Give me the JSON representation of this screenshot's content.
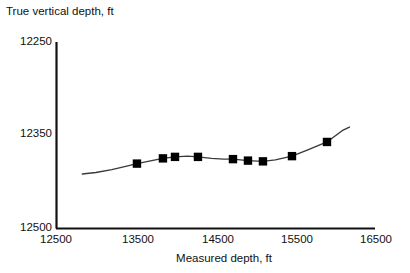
{
  "chart_data": {
    "type": "line",
    "title": "",
    "xlabel": "Measured depth, ft",
    "ylabel": "True vertical depth, ft",
    "xlim": [
      12500,
      16500
    ],
    "ylim": [
      12500,
      12250
    ],
    "y_inverted": true,
    "grid": false,
    "legend": null,
    "xticks": [
      12500,
      13500,
      14500,
      15500,
      16500
    ],
    "xtick_labels": [
      "12500",
      "13500",
      "14500",
      "15500",
      "16500"
    ],
    "yticks": [
      12250,
      12350,
      12500
    ],
    "ytick_labels": [
      "12250",
      "12350",
      "12500"
    ],
    "series": [
      {
        "name": "wellbore-survey-curve",
        "style": "line",
        "color": "#3a3a3a",
        "x": [
          12830,
          13000,
          13200,
          13400,
          13515,
          13700,
          13841,
          13992,
          14150,
          14280,
          14450,
          14600,
          14719,
          14907,
          15095,
          15250,
          15459,
          15650,
          15898,
          16100,
          16180
        ],
        "y": [
          12427,
          12425,
          12421,
          12416,
          12413,
          12409,
          12406,
          12404,
          12403,
          12404,
          12406,
          12407,
          12407,
          12409,
          12410,
          12408,
          12403,
          12395,
          12384,
          12368,
          12364
        ]
      },
      {
        "name": "survey-stations",
        "style": "markers",
        "marker": "square",
        "color": "#000000",
        "x": [
          13515,
          13841,
          13992,
          14280,
          14719,
          14907,
          15095,
          15459,
          15898
        ],
        "y": [
          12413,
          12406,
          12404,
          12404,
          12407,
          12409,
          12410,
          12403,
          12384
        ]
      }
    ]
  },
  "axis": {
    "ylabel": "True vertical depth, ft",
    "xlabel": "Measured depth, ft",
    "ytick_labels": [
      "12250",
      "12350",
      "12500"
    ],
    "xtick_labels": [
      "12500",
      "13500",
      "14500",
      "15500",
      "16500"
    ]
  }
}
